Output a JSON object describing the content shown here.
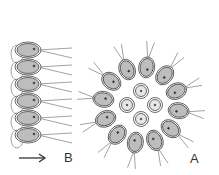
{
  "figure": {
    "label_a": "A",
    "label_b": "B",
    "arrow": "direction-arrow-right",
    "colors": {
      "line": "#444444",
      "cell_fill": "#bdbdbd",
      "inner_fill": "#e6e6e6",
      "background": "#ffffff"
    }
  }
}
